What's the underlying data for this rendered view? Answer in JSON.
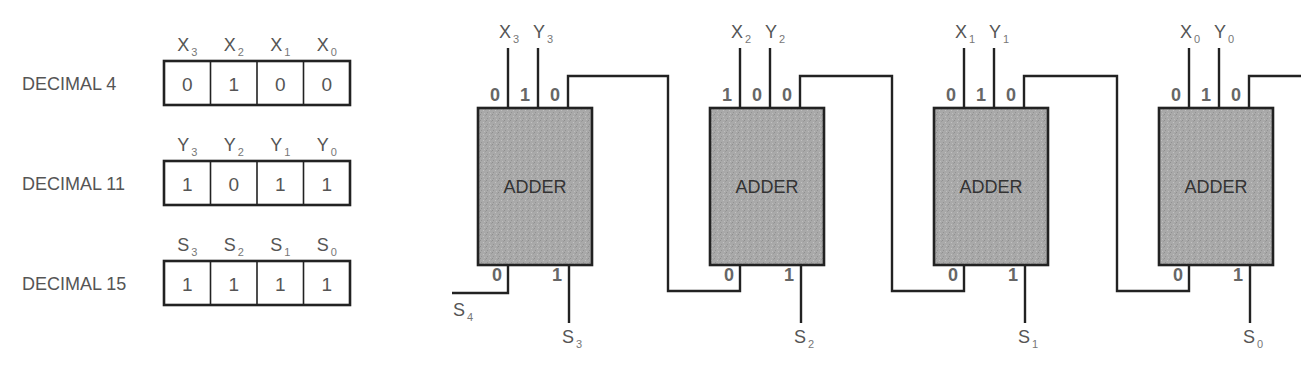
{
  "registers": [
    {
      "label": "DECIMAL 4",
      "var": "X",
      "bits": [
        "0",
        "1",
        "0",
        "0"
      ],
      "subs": [
        "3",
        "2",
        "1",
        "0"
      ]
    },
    {
      "label": "DECIMAL 11",
      "var": "Y",
      "bits": [
        "1",
        "0",
        "1",
        "1"
      ],
      "subs": [
        "3",
        "2",
        "1",
        "0"
      ]
    },
    {
      "label": "DECIMAL 15",
      "var": "S",
      "bits": [
        "1",
        "1",
        "1",
        "1"
      ],
      "subs": [
        "3",
        "2",
        "1",
        "0"
      ]
    }
  ],
  "adders": [
    {
      "label": "ADDER",
      "x_name": "X",
      "x_sub": "3",
      "y_name": "Y",
      "y_sub": "3",
      "in_bits": [
        "0",
        "1",
        "0"
      ],
      "carry_out": "0",
      "sum_bit": "1",
      "sum_name": "S",
      "sum_sub": "3"
    },
    {
      "label": "ADDER",
      "x_name": "X",
      "x_sub": "2",
      "y_name": "Y",
      "y_sub": "2",
      "in_bits": [
        "1",
        "0",
        "0"
      ],
      "carry_out": "0",
      "sum_bit": "1",
      "sum_name": "S",
      "sum_sub": "2"
    },
    {
      "label": "ADDER",
      "x_name": "X",
      "x_sub": "1",
      "y_name": "Y",
      "y_sub": "1",
      "in_bits": [
        "0",
        "1",
        "0"
      ],
      "carry_out": "0",
      "sum_bit": "1",
      "sum_name": "S",
      "sum_sub": "1"
    },
    {
      "label": "ADDER",
      "x_name": "X",
      "x_sub": "0",
      "y_name": "Y",
      "y_sub": "0",
      "in_bits": [
        "0",
        "1",
        "0"
      ],
      "carry_out": "0",
      "sum_bit": "1",
      "sum_name": "S",
      "sum_sub": "0"
    }
  ],
  "final_carry": {
    "name": "S",
    "sub": "4"
  },
  "colors": {
    "adder_fill": "#a8a8a8",
    "line": "#222222",
    "text": "#555555"
  }
}
